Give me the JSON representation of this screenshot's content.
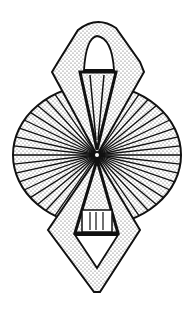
{
  "figure": {
    "colors": {
      "ink": "#111111",
      "background": "#ffffff",
      "stipple": "#555555"
    }
  }
}
